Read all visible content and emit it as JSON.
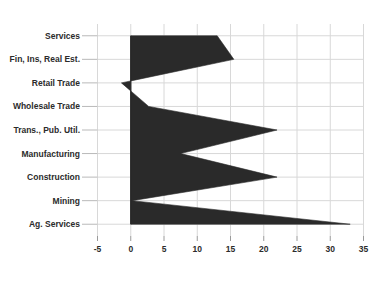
{
  "chart_data": {
    "type": "area",
    "title": "",
    "subtitle": "",
    "xlabel": "",
    "ylabel": "",
    "orientation": "horizontal",
    "grid": true,
    "legend": false,
    "legend_position": "none",
    "xlim": [
      -5,
      35
    ],
    "xticks": [
      -5,
      0,
      5,
      10,
      15,
      20,
      25,
      30,
      35
    ],
    "xtick_labels": [
      "-5",
      "0",
      "5",
      "10",
      "15",
      "20",
      "25",
      "30",
      "35"
    ],
    "baseline": 0,
    "series_color": "#2a2a2a",
    "grid_color": "#d8d8d8",
    "background_color": "#ffffff",
    "categories": [
      "Services",
      "Fin, Ins, Real Est.",
      "Retail Trade",
      "Wholesale Trade",
      "Trans., Pub. Util.",
      "Manufacturing",
      "Construction",
      "Mining",
      "Ag. Services"
    ],
    "values": [
      13,
      15.5,
      -1.4,
      2.7,
      22,
      7.5,
      22,
      0.2,
      33
    ],
    "series": [
      {
        "name": "",
        "values": [
          13,
          15.5,
          -1.4,
          2.7,
          22,
          7.5,
          22,
          0.2,
          33
        ]
      }
    ]
  },
  "axis": {
    "category_axis_name": "category-axis",
    "value_axis_name": "value-axis"
  }
}
